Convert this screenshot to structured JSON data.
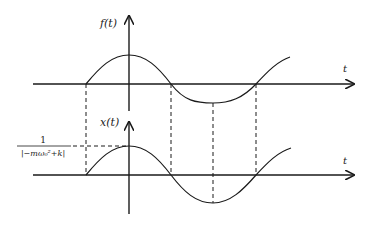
{
  "diagram": {
    "top_plot": {
      "y_label": "f(t)",
      "x_label": "t",
      "curve": "cosine starting at negative quarter-period"
    },
    "bottom_plot": {
      "y_label": "x(t)",
      "x_label": "t",
      "amplitude_label_numerator": "1",
      "amplitude_label_denominator": "|−mω₀²+k|"
    },
    "colors": {
      "line": "#1a1a1a",
      "background": "#ffffff"
    }
  }
}
